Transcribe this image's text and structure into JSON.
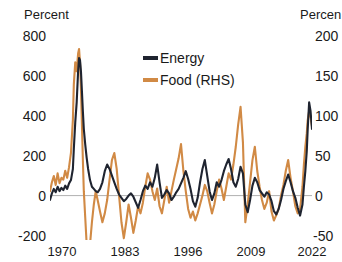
{
  "chart_data": {
    "type": "line",
    "title": "",
    "subtitle": "",
    "xlabel": "",
    "ylabel": "Percent",
    "ylabel_right": "Percent",
    "grid": false,
    "legend_position": "top-center",
    "x_ticks": [
      "1970",
      "1983",
      "1996",
      "2009",
      "2022"
    ],
    "x_tick_values": [
      1970,
      1983,
      1996,
      2009,
      2022
    ],
    "xlim": [
      1968,
      2023
    ],
    "left_axis": {
      "label": "Percent",
      "ticks": [
        "800",
        "600",
        "400",
        "200",
        "0",
        "-200"
      ],
      "tick_values": [
        800,
        600,
        400,
        200,
        0,
        -200
      ],
      "ylim": [
        -200,
        800
      ]
    },
    "right_axis": {
      "label": "Percent",
      "label_clipped": "Percen",
      "ticks": [
        "200",
        "150",
        "100",
        "50",
        "0",
        "-50"
      ],
      "tick_values": [
        200,
        150,
        100,
        50,
        0,
        -50
      ],
      "ylim": [
        -50,
        200
      ]
    },
    "series": [
      {
        "name": "Energy",
        "axis": "left",
        "color": "#1f2430",
        "x": [
          1968.0,
          1968.4,
          1968.8,
          1969.2,
          1969.6,
          1970.0,
          1970.4,
          1970.8,
          1971.2,
          1971.6,
          1972.0,
          1972.4,
          1972.8,
          1973.0,
          1973.3,
          1973.6,
          1973.9,
          1974.1,
          1974.3,
          1974.5,
          1974.7,
          1974.9,
          1975.1,
          1975.4,
          1975.7,
          1976.0,
          1976.4,
          1976.8,
          1977.2,
          1977.6,
          1978.0,
          1978.5,
          1979.0,
          1979.5,
          1980.0,
          1980.5,
          1981.0,
          1981.5,
          1982.0,
          1982.5,
          1983.0,
          1983.5,
          1984.0,
          1984.5,
          1985.0,
          1985.5,
          1986.0,
          1986.5,
          1987.0,
          1987.5,
          1988.0,
          1988.5,
          1989.0,
          1989.5,
          1990.0,
          1990.5,
          1991.0,
          1991.5,
          1992.0,
          1992.5,
          1993.0,
          1993.5,
          1994.0,
          1994.5,
          1995.0,
          1995.5,
          1996.0,
          1996.5,
          1997.0,
          1997.5,
          1998.0,
          1998.5,
          1999.0,
          1999.5,
          2000.0,
          2000.5,
          2001.0,
          2001.5,
          2002.0,
          2002.5,
          2003.0,
          2003.5,
          2004.0,
          2004.5,
          2005.0,
          2005.5,
          2006.0,
          2006.5,
          2007.0,
          2007.5,
          2008.0,
          2008.5,
          2009.0,
          2009.5,
          2010.0,
          2010.5,
          2011.0,
          2011.5,
          2012.0,
          2012.5,
          2013.0,
          2013.5,
          2014.0,
          2014.5,
          2015.0,
          2015.5,
          2016.0,
          2016.5,
          2017.0,
          2017.5,
          2018.0,
          2018.5,
          2019.0,
          2019.5,
          2020.0,
          2020.5,
          2021.0,
          2021.3,
          2021.6,
          2021.9,
          2022.1,
          2022.4,
          2022.7,
          2023.0
        ],
        "y": [
          -20,
          10,
          30,
          15,
          40,
          20,
          35,
          25,
          45,
          30,
          55,
          70,
          120,
          210,
          330,
          420,
          560,
          620,
          610,
          560,
          470,
          380,
          300,
          230,
          170,
          120,
          70,
          40,
          30,
          20,
          15,
          30,
          60,
          110,
          140,
          120,
          90,
          60,
          30,
          5,
          -10,
          -25,
          -15,
          0,
          10,
          -5,
          -30,
          -55,
          -20,
          20,
          45,
          30,
          60,
          40,
          80,
          140,
          60,
          -10,
          5,
          25,
          10,
          -20,
          -5,
          15,
          30,
          55,
          80,
          110,
          75,
          30,
          -25,
          -50,
          -10,
          60,
          120,
          160,
          90,
          20,
          -20,
          10,
          60,
          40,
          70,
          110,
          140,
          165,
          120,
          60,
          40,
          75,
          130,
          100,
          -40,
          -75,
          -20,
          45,
          80,
          60,
          25,
          10,
          -5,
          15,
          5,
          -25,
          -70,
          -85,
          -60,
          -20,
          30,
          65,
          95,
          60,
          20,
          -10,
          -55,
          -90,
          -40,
          40,
          110,
          200,
          300,
          420,
          380,
          300
        ]
      },
      {
        "name": "Food (RHS)",
        "axis": "right",
        "color": "#d18a45",
        "x": [
          1968.0,
          1968.4,
          1968.8,
          1969.2,
          1969.6,
          1970.0,
          1970.4,
          1970.8,
          1971.2,
          1971.6,
          1972.0,
          1972.4,
          1972.8,
          1973.0,
          1973.3,
          1973.6,
          1973.9,
          1974.1,
          1974.3,
          1974.5,
          1974.7,
          1974.9,
          1975.1,
          1975.4,
          1975.7,
          1976.0,
          1976.4,
          1976.8,
          1977.2,
          1977.6,
          1978.0,
          1978.5,
          1979.0,
          1979.5,
          1980.0,
          1980.5,
          1981.0,
          1981.5,
          1982.0,
          1982.5,
          1983.0,
          1983.5,
          1984.0,
          1984.5,
          1985.0,
          1985.5,
          1986.0,
          1986.5,
          1987.0,
          1987.5,
          1988.0,
          1988.5,
          1989.0,
          1989.5,
          1990.0,
          1990.5,
          1991.0,
          1991.5,
          1992.0,
          1992.5,
          1993.0,
          1993.5,
          1994.0,
          1994.5,
          1995.0,
          1995.5,
          1996.0,
          1996.5,
          1997.0,
          1997.5,
          1998.0,
          1998.5,
          1999.0,
          1999.5,
          2000.0,
          2000.5,
          2001.0,
          2001.5,
          2002.0,
          2002.5,
          2003.0,
          2003.5,
          2004.0,
          2004.5,
          2005.0,
          2005.5,
          2006.0,
          2006.5,
          2007.0,
          2007.5,
          2008.0,
          2008.5,
          2009.0,
          2009.5,
          2010.0,
          2010.5,
          2011.0,
          2011.5,
          2012.0,
          2012.5,
          2013.0,
          2013.5,
          2014.0,
          2014.5,
          2015.0,
          2015.5,
          2016.0,
          2016.5,
          2017.0,
          2017.5,
          2018.0,
          2018.5,
          2019.0,
          2019.5,
          2020.0,
          2020.5,
          2021.0,
          2021.3,
          2021.6,
          2021.9,
          2022.1,
          2022.4,
          2022.7,
          2023.0
        ],
        "y": [
          5,
          15,
          22,
          12,
          25,
          14,
          20,
          18,
          28,
          20,
          32,
          48,
          85,
          125,
          150,
          140,
          160,
          165,
          150,
          120,
          80,
          40,
          5,
          -25,
          -55,
          -70,
          -55,
          -30,
          -10,
          5,
          -5,
          -18,
          -30,
          -20,
          -5,
          18,
          40,
          48,
          30,
          0,
          -30,
          -48,
          -30,
          -10,
          -25,
          -42,
          -28,
          -12,
          -20,
          -8,
          10,
          25,
          18,
          5,
          -5,
          8,
          -12,
          -20,
          -5,
          10,
          -8,
          5,
          18,
          30,
          42,
          58,
          28,
          5,
          -15,
          -25,
          -18,
          -28,
          -20,
          -10,
          0,
          12,
          5,
          -8,
          -20,
          -10,
          5,
          18,
          8,
          -5,
          10,
          25,
          18,
          35,
          55,
          80,
          100,
          60,
          -30,
          -10,
          15,
          40,
          55,
          28,
          10,
          -5,
          -15,
          -8,
          5,
          -18,
          -28,
          -22,
          -15,
          0,
          12,
          28,
          40,
          20,
          5,
          -12,
          -20,
          -15,
          10,
          35,
          55,
          70,
          85,
          95,
          88,
          78
        ]
      }
    ],
    "annotations": [
      {
        "text": "zero reference line",
        "value": 0
      }
    ]
  },
  "legend": {
    "items": [
      {
        "label": "Energy",
        "color": "#1f2430"
      },
      {
        "label": "Food (RHS)",
        "color": "#d18a45"
      }
    ]
  },
  "axes": {
    "left_title": "Percent",
    "right_title": "Percen",
    "left_ticks": [
      "800",
      "600",
      "400",
      "200",
      "0",
      "-200"
    ],
    "right_ticks": [
      "200",
      "150",
      "100",
      "50",
      "0",
      "-50"
    ],
    "x_ticks": [
      "1970",
      "1983",
      "1996",
      "2009",
      "2022"
    ]
  },
  "colors": {
    "energy": "#1f2430",
    "food": "#d18a45",
    "zero_line": "#b0b0b0",
    "text": "#1a1a1a",
    "background": "#ffffff"
  }
}
